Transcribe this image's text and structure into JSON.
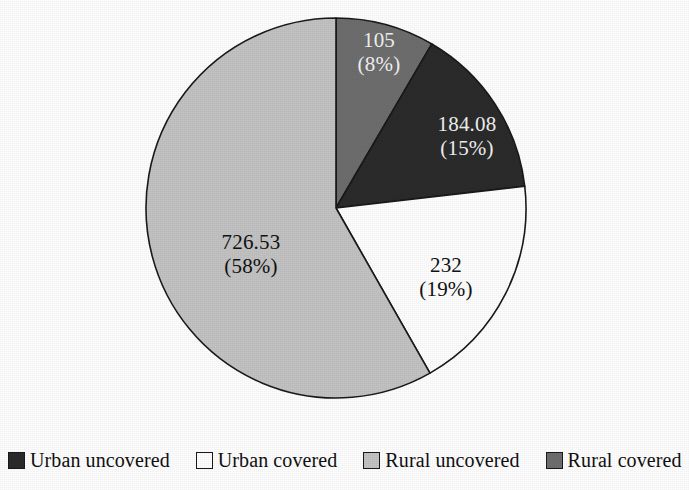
{
  "chart_data": {
    "type": "pie",
    "title": "",
    "subtitle": "",
    "xlabel": "",
    "ylabel": "",
    "legend_position": "bottom",
    "grid": false,
    "start_angle_deg": 0,
    "direction": "clockwise",
    "categories": [
      "Rural covered",
      "Urban uncovered",
      "Urban covered",
      "Rural uncovered"
    ],
    "values": [
      105,
      184.08,
      232,
      726.53
    ],
    "percents": [
      8,
      15,
      19,
      58
    ],
    "colors": [
      "#6e6e6e",
      "#2b2b2b",
      "#ffffff",
      "#c3c3c3"
    ],
    "slices": [
      {
        "name": "Rural covered",
        "value": 105,
        "percent": 8,
        "value_text": "105",
        "percent_text": "(8%)",
        "color": "#6e6e6e",
        "label_color": "light"
      },
      {
        "name": "Urban uncovered",
        "value": 184.08,
        "percent": 15,
        "value_text": "184.08",
        "percent_text": "(15%)",
        "color": "#2b2b2b",
        "label_color": "light"
      },
      {
        "name": "Urban covered",
        "value": 232,
        "percent": 19,
        "value_text": "232",
        "percent_text": "(19%)",
        "color": "#ffffff",
        "label_color": "dark"
      },
      {
        "name": "Rural uncovered",
        "value": 726.53,
        "percent": 58,
        "value_text": "726.53",
        "percent_text": "(58%)",
        "color": "#c3c3c3",
        "label_color": "dark"
      }
    ],
    "legend": [
      {
        "label": "Urban uncovered",
        "color": "#2b2b2b"
      },
      {
        "label": "Urban covered",
        "color": "#ffffff"
      },
      {
        "label": "Rural uncovered",
        "color": "#c3c3c3"
      },
      {
        "label": "Rural covered",
        "color": "#6e6e6e"
      }
    ]
  },
  "geometry": {
    "center_x": 336,
    "center_y": 208,
    "radius": 190,
    "outline_color": "#1a1a1a"
  }
}
